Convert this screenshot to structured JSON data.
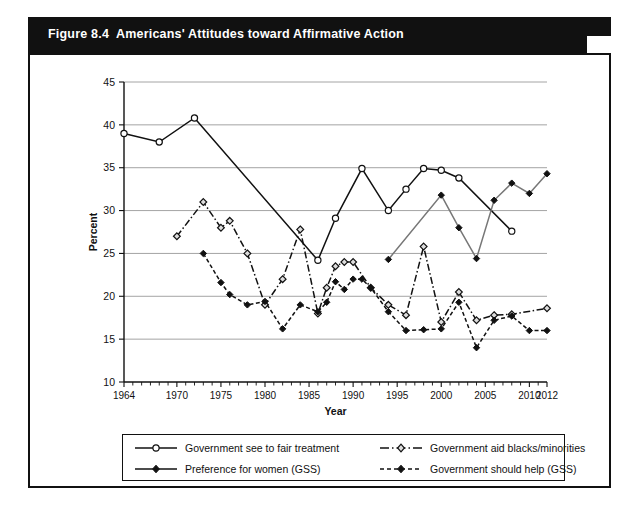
{
  "figure": {
    "number": "Figure 8.4",
    "title": "Americans' Attitudes toward Affirmative Action"
  },
  "colors": {
    "banner_bg": "#111111",
    "banner_text": "#ffffff",
    "card_border": "#111111",
    "grid": "#9a9a9a",
    "series_black": "#111111",
    "series_gray": "#777777"
  },
  "legend": {
    "items": [
      {
        "label": "Government see to fair treatment",
        "marker": "open-circle",
        "line": "solid",
        "color": "#111111"
      },
      {
        "label": "Government aid blacks/minorities",
        "marker": "open-diamond",
        "line": "dash-dot",
        "color": "#111111"
      },
      {
        "label": "Preference for women (GSS)",
        "marker": "filled-diamond",
        "line": "solid",
        "color": "#111111"
      },
      {
        "label": "Government should help (GSS)",
        "marker": "filled-diamond",
        "line": "dashed",
        "color": "#111111"
      }
    ]
  },
  "chart_data": {
    "type": "line",
    "title": "Americans' Attitudes toward Affirmative Action",
    "xlabel": "Year",
    "ylabel": "Percent",
    "xlim": [
      1964,
      2012
    ],
    "ylim": [
      10,
      45
    ],
    "yticks": [
      10,
      15,
      20,
      25,
      30,
      35,
      40,
      45
    ],
    "xticks": [
      1964,
      1970,
      1975,
      1980,
      1985,
      1990,
      1995,
      2000,
      2005,
      2010,
      2012
    ],
    "grid": "horizontal",
    "legend_position": "bottom",
    "series": [
      {
        "name": "Government see to fair treatment",
        "marker": "open-circle",
        "line": "solid",
        "color": "#111111",
        "points": [
          [
            1964,
            39.0
          ],
          [
            1968,
            38.0
          ],
          [
            1972,
            40.8
          ],
          [
            1986,
            24.2
          ],
          [
            1988,
            29.1
          ],
          [
            1991,
            34.9
          ],
          [
            1994,
            30.0
          ],
          [
            1996,
            32.5
          ],
          [
            1998,
            34.9
          ],
          [
            2000,
            34.7
          ],
          [
            2002,
            33.8
          ],
          [
            2008,
            27.6
          ]
        ]
      },
      {
        "name": "Preference for women (GSS)",
        "marker": "filled-diamond",
        "line": "solid",
        "color": "#777777",
        "points": [
          [
            1994,
            24.3
          ],
          [
            2000,
            31.8
          ],
          [
            2002,
            28.0
          ],
          [
            2004,
            24.4
          ],
          [
            2006,
            31.2
          ],
          [
            2008,
            33.2
          ],
          [
            2010,
            32.0
          ],
          [
            2012,
            34.3
          ]
        ]
      },
      {
        "name": "Government aid blacks/minorities",
        "marker": "open-diamond",
        "line": "dash-dot",
        "color": "#111111",
        "points": [
          [
            1970,
            27.0
          ],
          [
            1973,
            31.0
          ],
          [
            1975,
            28.0
          ],
          [
            1976,
            28.8
          ],
          [
            1978,
            25.0
          ],
          [
            1980,
            19.0
          ],
          [
            1982,
            22.0
          ],
          [
            1984,
            27.8
          ],
          [
            1986,
            18.0
          ],
          [
            1987,
            21.0
          ],
          [
            1988,
            23.5
          ],
          [
            1989,
            24.0
          ],
          [
            1990,
            24.0
          ],
          [
            1992,
            21.0
          ],
          [
            1994,
            19.0
          ],
          [
            1996,
            17.8
          ],
          [
            1998,
            25.8
          ],
          [
            2000,
            17.0
          ],
          [
            2002,
            20.5
          ],
          [
            2004,
            17.2
          ],
          [
            2006,
            17.8
          ],
          [
            2008,
            17.9
          ],
          [
            2012,
            18.6
          ]
        ]
      },
      {
        "name": "Government should help (GSS)",
        "marker": "filled-diamond",
        "line": "dashed",
        "color": "#111111",
        "points": [
          [
            1973,
            25.0
          ],
          [
            1975,
            21.6
          ],
          [
            1976,
            20.2
          ],
          [
            1978,
            19.0
          ],
          [
            1980,
            19.4
          ],
          [
            1982,
            16.2
          ],
          [
            1984,
            19.0
          ],
          [
            1986,
            18.2
          ],
          [
            1987,
            19.3
          ],
          [
            1988,
            21.7
          ],
          [
            1989,
            20.8
          ],
          [
            1990,
            22.0
          ],
          [
            1991,
            22.0
          ],
          [
            1992,
            21.0
          ],
          [
            1994,
            18.2
          ],
          [
            1996,
            16.0
          ],
          [
            1998,
            16.1
          ],
          [
            2000,
            16.2
          ],
          [
            2002,
            19.3
          ],
          [
            2004,
            14.0
          ],
          [
            2006,
            17.2
          ],
          [
            2008,
            17.7
          ],
          [
            2010,
            16.0
          ],
          [
            2012,
            16.0
          ]
        ]
      }
    ]
  }
}
